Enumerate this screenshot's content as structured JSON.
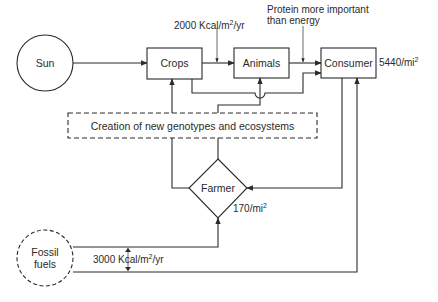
{
  "diagram": {
    "nodes": {
      "sun": {
        "label": "Sun",
        "shape": "circle"
      },
      "crops": {
        "label": "Crops",
        "shape": "box"
      },
      "animals": {
        "label": "Animals",
        "shape": "box"
      },
      "consumer": {
        "label": "Consumer",
        "shape": "box"
      },
      "genotypes": {
        "label": "Creation of new genotypes and ecosystems",
        "shape": "dashed-box"
      },
      "farmer": {
        "label": "Farmer",
        "shape": "diamond"
      },
      "fossil": {
        "label_line1": "Fossil",
        "label_line2": "fuels",
        "shape": "dashed-circle"
      }
    },
    "annotations": {
      "crops_animals_energy": {
        "value": "2000 Kcal/m",
        "exp": "2",
        "unit": "/yr"
      },
      "protein_note_line1": "Protein more important",
      "protein_note_line2": "than energy",
      "consumer_density": {
        "value": "5440/mi",
        "exp": "2"
      },
      "farmer_density": {
        "value": "170/mi",
        "exp": "2"
      },
      "fossil_energy": {
        "value": "3000 Kcal/m",
        "exp": "2",
        "unit": "/yr"
      }
    },
    "edges": [
      {
        "from": "Sun",
        "to": "Crops"
      },
      {
        "from": "Crops",
        "to": "Animals"
      },
      {
        "from": "Animals",
        "to": "Consumer"
      },
      {
        "from": "Crops",
        "to": "Consumer"
      },
      {
        "from": "Creation of new genotypes and ecosystems",
        "to": "Crops"
      },
      {
        "from": "Creation of new genotypes and ecosystems",
        "to": "Animals"
      },
      {
        "from": "Farmer",
        "to": "Creation of new genotypes and ecosystems"
      },
      {
        "from": "Consumer",
        "to": "Farmer"
      },
      {
        "from": "Fossil fuels",
        "to": "Farmer"
      },
      {
        "from": "Fossil fuels",
        "to": "Consumer"
      }
    ],
    "colors": {
      "line": "#2a2a2a",
      "background": "#ffffff"
    }
  }
}
